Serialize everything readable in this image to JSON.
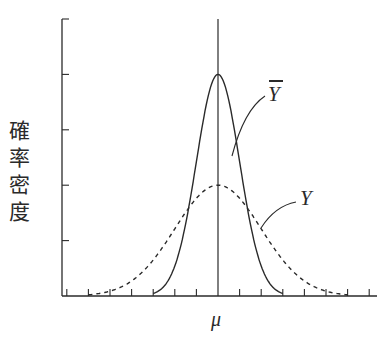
{
  "chart_data": {
    "type": "line",
    "title": "",
    "xlabel": "μ",
    "ylabel": "確率密度",
    "x_center_label": "μ",
    "grid": false,
    "legend": "none (inline labels)",
    "y_ticks_count": 5,
    "x_ticks_count": 15,
    "series": [
      {
        "name": "Ȳ",
        "style": "solid",
        "distribution": "normal",
        "mean": 0,
        "sd": 1,
        "peak_density_ticks": 4,
        "support_x": [
          -3,
          3
        ]
      },
      {
        "name": "Y",
        "style": "dashed",
        "distribution": "normal",
        "mean": 0,
        "sd": 2,
        "peak_density_ticks": 2,
        "support_x": [
          -6,
          6
        ]
      }
    ],
    "annotations": [
      {
        "text": "Ȳ",
        "points_to": "solid curve"
      },
      {
        "text": "Y",
        "points_to": "dashed curve"
      },
      {
        "text": "μ",
        "position": "x-axis center, vertical line"
      }
    ]
  },
  "labels": {
    "ylabel_chars": [
      "確",
      "率",
      "密",
      "度"
    ],
    "ybar": "Y",
    "y": "Y",
    "mu": "μ"
  },
  "colors": {
    "ink": "#2a2a2a",
    "background": "#ffffff"
  }
}
